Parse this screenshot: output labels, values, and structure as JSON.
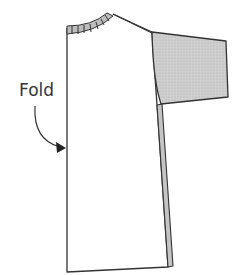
{
  "diagram": {
    "labels": {
      "fold": "Fold"
    },
    "colors": {
      "outline": "#333333",
      "shaded": "#c9c9c9",
      "ribbing": "#bdbdbd",
      "background": "#ffffff"
    },
    "parts": [
      "body-panel",
      "neckband-ribbing",
      "sleeve",
      "side-seam-strip",
      "fold-arrow"
    ]
  }
}
